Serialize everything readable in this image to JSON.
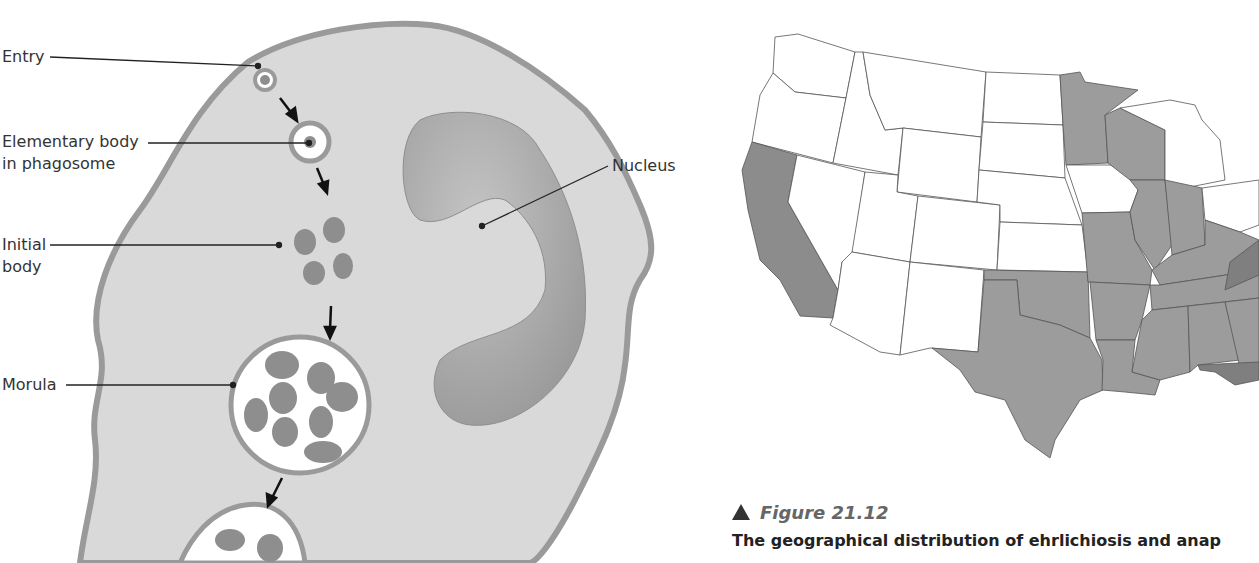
{
  "diagram": {
    "labels": {
      "entry": "Entry",
      "elementary_line1": "Elementary body",
      "elementary_line2": "in phagosome",
      "initial_line1": "Initial",
      "initial_line2": "body",
      "morula": "Morula",
      "nucleus": "Nucleus"
    },
    "colors": {
      "cytoplasm": "#d9d9d9",
      "membrane": "#9a9a9a",
      "nucleus": "#a9a9a9",
      "bodies": "#8e8e8e"
    }
  },
  "map": {
    "title": "United States distribution map",
    "shaded_states": [
      "California",
      "Minnesota",
      "Wisconsin",
      "Illinois",
      "Indiana",
      "Missouri",
      "Oklahoma",
      "Texas",
      "Arkansas",
      "Louisiana",
      "Mississippi",
      "Alabama",
      "Georgia",
      "Tennessee",
      "Kentucky",
      "Virginia",
      "Florida"
    ],
    "colors": {
      "shaded": "#9c9c9c",
      "dark": "#7f7f7f",
      "unshaded": "#ffffff",
      "border": "#555555"
    }
  },
  "caption": {
    "figure_label": "Figure 21.12",
    "text": "The geographical distribution of ehrlichiosis and anap"
  }
}
